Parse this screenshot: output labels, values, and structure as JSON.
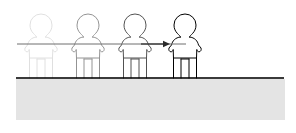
{
  "canvas": {
    "width": 296,
    "height": 133,
    "background_color": "#ffffff"
  },
  "illustration": {
    "name": "person-walking-sequence",
    "description": "Four outlined human figures standing on a ground line, fading in from left to right, with a horizontal reference line at arm height and a rightward motion arrow",
    "line_color": "#000000"
  },
  "ground": {
    "name": "ground",
    "fill_color": "#e4e4e4",
    "line_color": "#3a3a3a",
    "line_y": 78,
    "line_x_start": 16,
    "line_x_end": 284,
    "fill_top": 79,
    "fill_bottom": 120,
    "fill_x_start": 16,
    "fill_x_end": 285
  },
  "reference_line": {
    "name": "arm-height-reference-line",
    "color": "#6e6e6e",
    "y": 44,
    "x_start": 17,
    "x_end": 186
  },
  "arrow": {
    "name": "motion-arrow",
    "color": "#2b2b2b",
    "direction": "right",
    "x_start": 141,
    "x_end": 170,
    "y": 44
  },
  "figures": [
    {
      "label": "figure-1",
      "order": 1,
      "opacity": 0.12,
      "center_x": 41,
      "head_center_y": 25,
      "head_radius": 11,
      "body_top": 36,
      "body_bottom": 58,
      "body_half_width": 16,
      "legs_bottom": 78,
      "leg_gap_half_width": 4,
      "leg_top": 58,
      "hand_y": 50
    },
    {
      "label": "figure-2",
      "order": 2,
      "opacity": 0.42,
      "center_x": 88,
      "head_center_y": 25,
      "head_radius": 11,
      "body_top": 36,
      "body_bottom": 58,
      "body_half_width": 16,
      "legs_bottom": 78,
      "leg_gap_half_width": 4,
      "leg_top": 58,
      "hand_y": 50
    },
    {
      "label": "figure-3",
      "order": 3,
      "opacity": 0.68,
      "center_x": 135,
      "head_center_y": 25,
      "head_radius": 11,
      "body_top": 36,
      "body_bottom": 58,
      "body_half_width": 16,
      "legs_bottom": 78,
      "leg_gap_half_width": 4,
      "leg_top": 58,
      "hand_y": 50
    },
    {
      "label": "figure-4",
      "order": 4,
      "opacity": 1.0,
      "center_x": 185,
      "head_center_y": 25,
      "head_radius": 11,
      "body_top": 36,
      "body_bottom": 58,
      "body_half_width": 16,
      "legs_bottom": 78,
      "leg_gap_half_width": 4,
      "leg_top": 58,
      "hand_y": 50
    }
  ]
}
